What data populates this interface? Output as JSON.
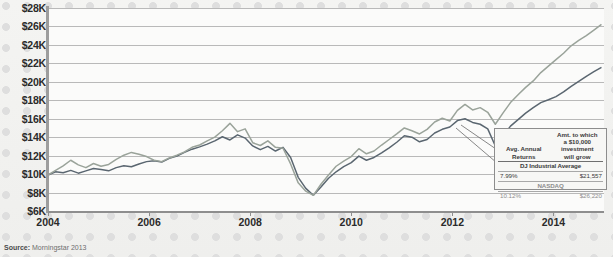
{
  "source_note": {
    "prefix": "Source:",
    "text": "Morningstar 2013"
  },
  "legend": {
    "header_left": "Avg. Annual Returns",
    "header_left_lines": [
      "Avg. Annual",
      "Returns"
    ],
    "header_right_lines": [
      "Amt. to which",
      "a $10,000",
      "investment",
      "will grow"
    ],
    "rows": [
      {
        "name": "DJ Industrial Average",
        "avg_annual_return": "7.99%",
        "growth": "$21,557"
      },
      {
        "name": "NASDAQ",
        "avg_annual_return": "10.12%",
        "growth": "$26,220"
      }
    ]
  },
  "chart_data": {
    "type": "line",
    "title": "",
    "xlabel": "",
    "ylabel": "",
    "xlim": [
      2004,
      2015.0
    ],
    "ylim": [
      6000,
      28000
    ],
    "grid": true,
    "legend_position": "inset-bottom-right",
    "y_ticks": [
      6000,
      8000,
      10000,
      12000,
      14000,
      16000,
      18000,
      20000,
      22000,
      24000,
      26000,
      28000
    ],
    "y_tick_labels": [
      "$6K",
      "$8K",
      "$10K",
      "$12K",
      "$14K",
      "$16K",
      "$18K",
      "$20K",
      "$22K",
      "$24K",
      "$26K",
      "$28K"
    ],
    "x_ticks": [
      2004,
      2006,
      2008,
      2010,
      2012,
      2014
    ],
    "x_tick_labels": [
      "2004",
      "2006",
      "2008",
      "2010",
      "2012",
      "2014"
    ],
    "colors": {
      "dj": "#5a6670",
      "nasdaq": "#9aa39a"
    },
    "series": [
      {
        "name": "DJ Industrial Average",
        "color": "#5a6670",
        "x": [
          2004.0,
          2004.15,
          2004.3,
          2004.45,
          2004.6,
          2004.75,
          2004.9,
          2005.05,
          2005.2,
          2005.35,
          2005.5,
          2005.65,
          2005.8,
          2005.95,
          2006.1,
          2006.25,
          2006.4,
          2006.55,
          2006.7,
          2006.85,
          2007.0,
          2007.15,
          2007.3,
          2007.45,
          2007.6,
          2007.75,
          2007.9,
          2008.05,
          2008.2,
          2008.35,
          2008.5,
          2008.65,
          2008.8,
          2008.95,
          2009.1,
          2009.25,
          2009.4,
          2009.55,
          2009.7,
          2009.85,
          2010.0,
          2010.15,
          2010.3,
          2010.45,
          2010.6,
          2010.75,
          2010.9,
          2011.05,
          2011.2,
          2011.35,
          2011.5,
          2011.65,
          2011.8,
          2011.95,
          2012.1,
          2012.25,
          2012.4,
          2012.55,
          2012.7,
          2012.85,
          2013.0,
          2013.15,
          2013.3,
          2013.45,
          2013.6,
          2013.75,
          2013.9,
          2014.05,
          2014.2,
          2014.35,
          2014.5,
          2014.65,
          2014.8,
          2014.95
        ],
        "y": [
          9900,
          10250,
          10150,
          10400,
          10100,
          10350,
          10600,
          10500,
          10350,
          10700,
          10900,
          10800,
          11100,
          11350,
          11450,
          11300,
          11700,
          11950,
          12350,
          12700,
          12950,
          13250,
          13600,
          14050,
          13700,
          14250,
          13900,
          13050,
          12650,
          13000,
          12500,
          12900,
          11800,
          9650,
          8450,
          7700,
          8600,
          9550,
          10250,
          10800,
          11250,
          11950,
          11500,
          11800,
          12300,
          12850,
          13450,
          14150,
          14000,
          13500,
          13750,
          14450,
          14850,
          15100,
          15800,
          16000,
          15600,
          15400,
          14900,
          13050,
          14100,
          15200,
          15900,
          16600,
          17200,
          17750,
          18050,
          18400,
          18900,
          19500,
          20050,
          20600,
          21100,
          21557
        ]
      },
      {
        "name": "NASDAQ",
        "color": "#9aa39a",
        "x": [
          2004.0,
          2004.15,
          2004.3,
          2004.45,
          2004.6,
          2004.75,
          2004.9,
          2005.05,
          2005.2,
          2005.35,
          2005.5,
          2005.65,
          2005.8,
          2005.95,
          2006.1,
          2006.25,
          2006.4,
          2006.55,
          2006.7,
          2006.85,
          2007.0,
          2007.15,
          2007.3,
          2007.45,
          2007.6,
          2007.75,
          2007.9,
          2008.05,
          2008.2,
          2008.35,
          2008.5,
          2008.65,
          2008.8,
          2008.95,
          2009.1,
          2009.25,
          2009.4,
          2009.55,
          2009.7,
          2009.85,
          2010.0,
          2010.15,
          2010.3,
          2010.45,
          2010.6,
          2010.75,
          2010.9,
          2011.05,
          2011.2,
          2011.35,
          2011.5,
          2011.65,
          2011.8,
          2011.95,
          2012.1,
          2012.25,
          2012.4,
          2012.55,
          2012.7,
          2012.85,
          2013.0,
          2013.15,
          2013.3,
          2013.45,
          2013.6,
          2013.75,
          2013.9,
          2014.05,
          2014.2,
          2014.35,
          2014.5,
          2014.65,
          2014.8,
          2014.95
        ],
        "y": [
          9900,
          10400,
          10900,
          11500,
          11000,
          10700,
          11150,
          10850,
          11050,
          11600,
          12050,
          12350,
          12150,
          11900,
          11500,
          11350,
          11750,
          12050,
          12400,
          12900,
          13150,
          13600,
          14000,
          14700,
          15500,
          14600,
          14900,
          13400,
          13100,
          13600,
          12900,
          12800,
          11100,
          9050,
          8150,
          7700,
          8900,
          9900,
          10850,
          11400,
          11900,
          12750,
          12200,
          12500,
          13150,
          13750,
          14350,
          15000,
          14700,
          14350,
          14850,
          15650,
          16050,
          15750,
          16900,
          17550,
          16950,
          17200,
          16700,
          15400,
          16600,
          17750,
          18600,
          19400,
          20100,
          21000,
          21700,
          22400,
          23100,
          23900,
          24500,
          25000,
          25600,
          26220
        ]
      }
    ]
  }
}
